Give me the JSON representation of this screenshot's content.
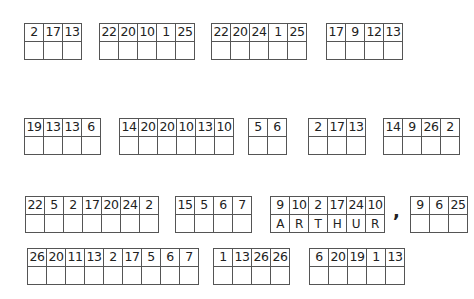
{
  "puzzle": {
    "rows": [
      {
        "groups": [
          {
            "numbers": [
              "2",
              "17",
              "13"
            ],
            "answers": [
              "",
              "",
              ""
            ]
          },
          {
            "numbers": [
              "22",
              "20",
              "10",
              "1",
              "25"
            ],
            "answers": [
              "",
              "",
              "",
              "",
              ""
            ]
          },
          {
            "numbers": [
              "22",
              "20",
              "24",
              "1",
              "25"
            ],
            "answers": [
              "",
              "",
              "",
              "",
              ""
            ]
          },
          {
            "numbers": [
              "17",
              "9",
              "12",
              "13"
            ],
            "answers": [
              "",
              "",
              "",
              ""
            ]
          }
        ]
      },
      {
        "groups": [
          {
            "numbers": [
              "19",
              "13",
              "13",
              "6"
            ],
            "answers": [
              "",
              "",
              "",
              ""
            ]
          },
          {
            "numbers": [
              "14",
              "20",
              "20",
              "10",
              "13",
              "10"
            ],
            "answers": [
              "",
              "",
              "",
              "",
              "",
              ""
            ]
          },
          {
            "numbers": [
              "5",
              "6"
            ],
            "answers": [
              "",
              ""
            ]
          },
          {
            "numbers": [
              "2",
              "17",
              "13"
            ],
            "answers": [
              "",
              "",
              ""
            ]
          },
          {
            "numbers": [
              "14",
              "9",
              "26",
              "2"
            ],
            "answers": [
              "",
              "",
              "",
              ""
            ]
          }
        ]
      },
      {
        "groups": [
          {
            "numbers": [
              "22",
              "5",
              "2",
              "17",
              "20",
              "24",
              "2"
            ],
            "answers": [
              "",
              "",
              "",
              "",
              "",
              "",
              ""
            ]
          },
          {
            "numbers": [
              "15",
              "5",
              "6",
              "7"
            ],
            "answers": [
              "",
              "",
              "",
              ""
            ]
          },
          {
            "numbers": [
              "9",
              "10",
              "2",
              "17",
              "24",
              "10"
            ],
            "answers": [
              "A",
              "R",
              "T",
              "H",
              "U",
              "R"
            ]
          },
          {
            "numbers": [
              "9",
              "6",
              "25"
            ],
            "answers": [
              "",
              "",
              ""
            ]
          }
        ],
        "punctuation": ","
      },
      {
        "groups": [
          {
            "numbers": [
              "26",
              "20",
              "11",
              "13",
              "2",
              "17",
              "5",
              "6",
              "7"
            ],
            "answers": [
              "",
              "",
              "",
              "",
              "",
              "",
              "",
              "",
              ""
            ]
          },
          {
            "numbers": [
              "1",
              "13",
              "26",
              "26"
            ],
            "answers": [
              "",
              "",
              "",
              ""
            ]
          },
          {
            "numbers": [
              "6",
              "20",
              "19",
              "1",
              "13"
            ],
            "answers": [
              "",
              "",
              "",
              "",
              ""
            ]
          }
        ]
      }
    ]
  }
}
